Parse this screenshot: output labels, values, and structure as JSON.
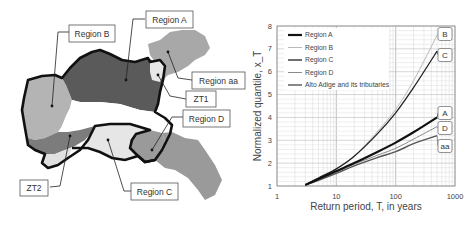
{
  "map": {
    "labels": [
      {
        "id": "region-a",
        "text": "Region A"
      },
      {
        "id": "region-b",
        "text": "Region B"
      },
      {
        "id": "region-aa",
        "text": "Region aa"
      },
      {
        "id": "zt1",
        "text": "ZT1"
      },
      {
        "id": "region-d",
        "text": "Region D"
      },
      {
        "id": "zt2",
        "text": "ZT2"
      },
      {
        "id": "region-c",
        "text": "Region C"
      }
    ],
    "colors": {
      "region_a": "#5a5a5a",
      "region_b": "#b4b4b4",
      "region_c": "#e6e6e6",
      "region_d": "#9a9a9a",
      "region_aa": "#a8a8a8",
      "zt1": "#e8e8e8",
      "zt2": "#7c7c7c",
      "border": "#111111"
    }
  },
  "chart_data": {
    "type": "line",
    "title": "",
    "xlabel": "Return period, T, in years",
    "ylabel": "Normalized quantile, x_T",
    "xscale": "log",
    "xlim": [
      1,
      1000
    ],
    "ylim": [
      1,
      8
    ],
    "xticks": [
      "1",
      "10",
      "100",
      "1000"
    ],
    "yticks": [
      "1",
      "2",
      "3",
      "4",
      "5",
      "6",
      "7",
      "8"
    ],
    "grid": true,
    "legend_position": "upper left",
    "x": [
      3,
      5,
      10,
      20,
      50,
      100,
      200,
      500
    ],
    "series": [
      {
        "name": "Region A",
        "end_label": "A",
        "color": "#111111",
        "width": 2.2,
        "values": [
          1.05,
          1.3,
          1.65,
          2.0,
          2.5,
          2.9,
          3.35,
          4.0
        ]
      },
      {
        "name": "Region B",
        "end_label": "B",
        "color": "#b8b8b8",
        "width": 1.0,
        "values": [
          1.05,
          1.35,
          1.75,
          2.3,
          3.4,
          4.35,
          5.6,
          7.6
        ]
      },
      {
        "name": "Region C",
        "end_label": "C",
        "color": "#222222",
        "width": 1.3,
        "values": [
          1.05,
          1.35,
          1.75,
          2.3,
          3.3,
          4.2,
          5.3,
          6.9
        ]
      },
      {
        "name": "Region D",
        "end_label": "D",
        "color": "#8a8a8a",
        "width": 1.0,
        "values": [
          1.05,
          1.28,
          1.6,
          1.95,
          2.35,
          2.65,
          3.05,
          3.6
        ]
      },
      {
        "name": "Alto Adige and its tributaries",
        "end_label": "aa",
        "color": "#555555",
        "width": 1.4,
        "values": [
          1.05,
          1.25,
          1.55,
          1.88,
          2.25,
          2.5,
          2.85,
          3.2
        ]
      }
    ]
  }
}
